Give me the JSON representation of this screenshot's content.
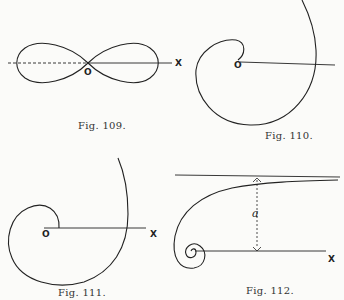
{
  "figures": [
    {
      "id": "fig109",
      "caption": "Fig. 109.",
      "labels": {
        "origin": "O",
        "axis": "X"
      },
      "curve": "lemniscate"
    },
    {
      "id": "fig110",
      "caption": "Fig. 110.",
      "labels": {
        "origin": "O"
      },
      "curve": "spiral"
    },
    {
      "id": "fig111",
      "caption": "Fig. 111.",
      "labels": {
        "origin": "O",
        "axis": "X"
      },
      "curve": "spiral"
    },
    {
      "id": "fig112",
      "caption": "Fig. 112.",
      "labels": {
        "distance": "a",
        "axis": "X"
      },
      "curve": "lituus"
    }
  ]
}
